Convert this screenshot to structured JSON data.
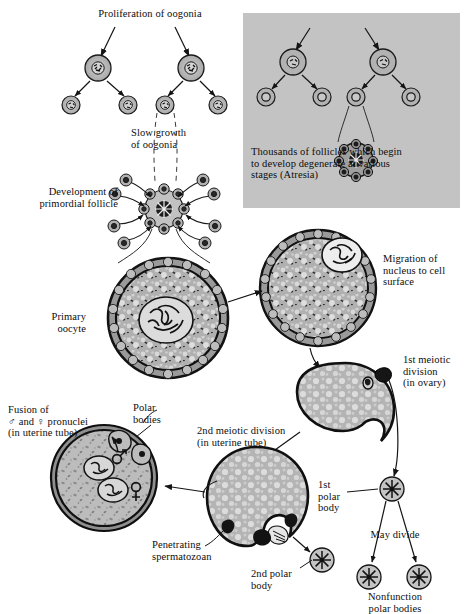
{
  "figure": {
    "type": "biological-process-diagram",
    "background_color": "#ffffff",
    "ink_color": "#111111",
    "cell_fill": "#b9b9b9",
    "cytoplasm_fill": "#b2b2b2",
    "panel_fill": "#c3c3c3"
  },
  "labels": {
    "proliferation": "Proliferation of oogonia",
    "slow_growth": "Slow growth\nof oogonia",
    "primordial_follicle": "Development of\nprimordial follicle",
    "atresia_panel": "Thousands of follicles which begin\nto develop degenerate at various\nstages (Atresia)",
    "primary_oocyte": "Primary\noocyte",
    "migration": "Migration of\nnucleus to cell\nsurface",
    "first_meiotic": "1st meiotic\ndivision\n(in ovary)",
    "first_polar_body": "1st\npolar\nbody",
    "may_divide": "May divide",
    "nonfunction": "Nonfunction\npolar bodies",
    "second_meiotic": "2nd meiotic division\n(in uterine tube)",
    "second_polar_body": "2nd polar\nbody",
    "penetrating_sperm": "Penetrating\nspermatozoan",
    "polar_bodies": "Polar\nbodies",
    "fusion": "Fusion of\n♂ and ♀ pronuclei\n(in uterine tube)"
  },
  "stages": [
    {
      "id": "oogonium-parent-left",
      "name": "oogonium",
      "x": 98,
      "y": 68,
      "r": 13
    },
    {
      "id": "oogonium-parent-right",
      "name": "oogonium",
      "x": 191,
      "y": 68,
      "r": 13
    },
    {
      "id": "oogonium-daughter-1",
      "name": "oogonium-daughter",
      "x": 71,
      "y": 105,
      "r": 9
    },
    {
      "id": "oogonium-daughter-2",
      "name": "oogonium-daughter",
      "x": 128,
      "y": 105,
      "r": 9
    },
    {
      "id": "oogonium-daughter-3",
      "name": "oogonium-daughter",
      "x": 165,
      "y": 105,
      "r": 9
    },
    {
      "id": "oogonium-daughter-4",
      "name": "oogonium-daughter",
      "x": 218,
      "y": 105,
      "r": 9
    },
    {
      "id": "primordial-follicle",
      "name": "primordial-follicle",
      "x": 164,
      "y": 209,
      "r": 18
    },
    {
      "id": "primary-oocyte",
      "name": "primary-oocyte",
      "x": 168,
      "y": 318,
      "r": 60
    },
    {
      "id": "migrating-oocyte",
      "name": "migrating-nucleus-oocyte",
      "x": 318,
      "y": 288,
      "r": 58
    },
    {
      "id": "first-division-cell",
      "name": "secondary-oocyte",
      "x": 345,
      "y": 410,
      "r": 47
    },
    {
      "id": "second-division-cell",
      "name": "second-meiotic-oocyte",
      "x": 257,
      "y": 497,
      "r": 50
    },
    {
      "id": "fertilized-ovum",
      "name": "fertilized-ovum",
      "x": 104,
      "y": 478,
      "r": 52
    },
    {
      "id": "first-polar-body",
      "name": "polar-body",
      "x": 392,
      "y": 489,
      "r": 12
    },
    {
      "id": "second-polar-body",
      "name": "polar-body",
      "x": 322,
      "y": 560,
      "r": 12
    },
    {
      "id": "nonfunction-body-1",
      "name": "polar-body",
      "x": 369,
      "y": 577,
      "r": 12
    },
    {
      "id": "nonfunction-body-2",
      "name": "polar-body",
      "x": 419,
      "y": 577,
      "r": 12
    }
  ],
  "panel": {
    "x": 243,
    "y": 13,
    "width": 217,
    "height": 195
  }
}
